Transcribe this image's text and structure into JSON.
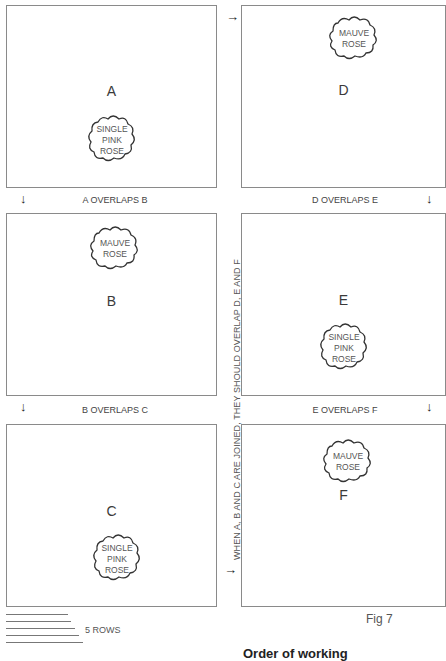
{
  "panels": {
    "A": {
      "letter": "A",
      "rose": [
        "SINGLE",
        "PINK",
        "ROSE"
      ]
    },
    "B": {
      "letter": "B",
      "rose": [
        "MAUVE",
        "ROSE"
      ]
    },
    "C": {
      "letter": "C",
      "rose": [
        "SINGLE",
        "PINK",
        "ROSE"
      ]
    },
    "D": {
      "letter": "D",
      "rose": [
        "MAUVE",
        "ROSE"
      ]
    },
    "E": {
      "letter": "E",
      "rose": [
        "SINGLE",
        "PINK",
        "ROSE"
      ]
    },
    "F": {
      "letter": "F",
      "rose": [
        "MAUVE",
        "ROSE"
      ]
    }
  },
  "overlaps": {
    "ab": "A OVERLAPS B",
    "bc": "B OVERLAPS C",
    "de": "D OVERLAPS E",
    "ef": "E OVERLAPS F"
  },
  "arrows": {
    "down": "↓",
    "right": "→"
  },
  "vertical_note": "WHEN A, B AND C ARE JOINED, THEY SHOULD OVERLAP D, E AND F",
  "rows_label": "5 ROWS",
  "figure_label": "Fig 7",
  "order_heading": "Order of working"
}
